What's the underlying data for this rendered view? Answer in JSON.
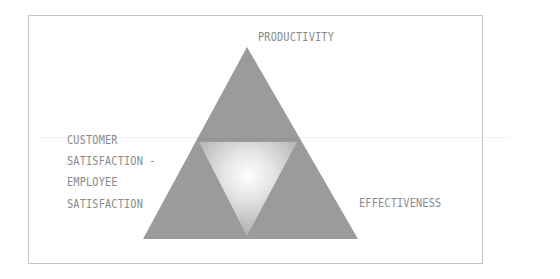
{
  "diagram": {
    "type": "triangle-model",
    "vertices": {
      "top": "PRODUCTIVITY",
      "left": [
        "CUSTOMER",
        "SATISFACTION -",
        "EMPLOYEE",
        "SATISFACTION"
      ],
      "right": "EFFECTIVENESS"
    },
    "colors": {
      "triangle_fill": "#9a9a9a",
      "inner_glow_center": "#ffffff",
      "inner_glow_edge": "#bdbdbd",
      "label_text": "#8a8a8a",
      "frame_border": "#c4c4c4"
    }
  }
}
